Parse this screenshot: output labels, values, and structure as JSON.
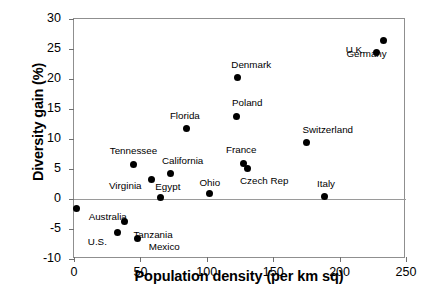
{
  "chart_data": {
    "type": "scatter",
    "title": "",
    "xlabel": "Population density (per km sq)",
    "ylabel": "Diversity gain (%)",
    "xlim": [
      0,
      250
    ],
    "ylim": [
      -10,
      30
    ],
    "xticks": [
      0,
      50,
      100,
      150,
      200,
      250
    ],
    "yticks": [
      -10,
      -5,
      0,
      5,
      10,
      15,
      20,
      25,
      30
    ],
    "xtick_labels": [
      "0",
      "50",
      "100",
      "150",
      "200",
      "250"
    ],
    "ytick_labels": [
      "-10",
      "-5",
      "0",
      "5",
      "10",
      "15",
      "20",
      "25",
      "30"
    ],
    "grid": false,
    "legend": "none",
    "zero_line": true,
    "marker": "filled-circle",
    "marker_color": "#000000",
    "points": [
      {
        "label": "Australia",
        "x": 2,
        "y": -1.5,
        "lx": 12,
        "ly": 4
      },
      {
        "label": "U.S.",
        "x": 33,
        "y": -5.5,
        "lx": -30,
        "ly": 5
      },
      {
        "label": "Tanzania",
        "x": 38,
        "y": -3.7,
        "lx": 9,
        "ly": 9
      },
      {
        "label": "Mexico",
        "x": 48,
        "y": -6.5,
        "lx": 11,
        "ly": 4
      },
      {
        "label": "Tennessee",
        "x": 45,
        "y": 5.8,
        "lx": -24,
        "ly": -18
      },
      {
        "label": "Virginia",
        "x": 58,
        "y": 3.2,
        "lx": -42,
        "ly": 1
      },
      {
        "label": "California",
        "x": 73,
        "y": 4.2,
        "lx": -9,
        "ly": -18
      },
      {
        "label": "Egypt",
        "x": 65,
        "y": 0.2,
        "lx": -5,
        "ly": -16
      },
      {
        "label": "Florida",
        "x": 85,
        "y": 11.8,
        "lx": -17,
        "ly": -17
      },
      {
        "label": "Ohio",
        "x": 102,
        "y": 0.9,
        "lx": -10,
        "ly": -16
      },
      {
        "label": "Poland",
        "x": 122,
        "y": 13.8,
        "lx": -4,
        "ly": -18
      },
      {
        "label": "Denmark",
        "x": 123,
        "y": 20.2,
        "lx": -6,
        "ly": -18
      },
      {
        "label": "France",
        "x": 128,
        "y": 6.0,
        "lx": -18,
        "ly": -18
      },
      {
        "label": "Czech Rep",
        "x": 131,
        "y": 5.1,
        "lx": -8,
        "ly": 8
      },
      {
        "label": "Switzerland",
        "x": 175,
        "y": 9.5,
        "lx": -4,
        "ly": -17
      },
      {
        "label": "Italy",
        "x": 189,
        "y": 0.5,
        "lx": -8,
        "ly": -17
      },
      {
        "label": "U.K.",
        "x": 228,
        "y": 24.5,
        "lx": -31,
        "ly": -7
      },
      {
        "label": "Germany",
        "x": 233,
        "y": 26.5,
        "lx": -37,
        "ly": 9
      }
    ]
  }
}
